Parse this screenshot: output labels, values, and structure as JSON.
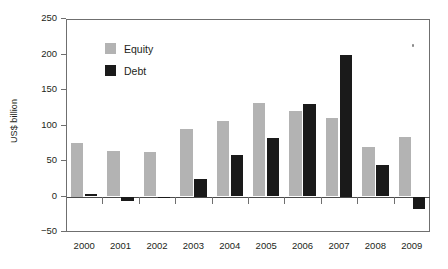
{
  "chart_data": {
    "type": "bar",
    "title": "",
    "xlabel": "",
    "ylabel": "US$ billion",
    "ylim": [
      -50,
      250
    ],
    "yticks": [
      -50,
      0,
      50,
      100,
      150,
      200,
      250
    ],
    "ytick_labels": [
      "−50",
      "0",
      "50",
      "100",
      "150",
      "200",
      "250"
    ],
    "grid": false,
    "legend_position": "upper-left-inside",
    "categories": [
      "2000",
      "2001",
      "2002",
      "2003",
      "2004",
      "2005",
      "2006",
      "2007",
      "2008",
      "2009"
    ],
    "series": [
      {
        "name": "Equity",
        "color": "#b3b3b3",
        "values": [
          75,
          64,
          62,
          95,
          106,
          131,
          120,
          111,
          70,
          84
        ]
      },
      {
        "name": "Debt",
        "color": "#1a1a1a",
        "values": [
          4,
          -6,
          -2,
          25,
          59,
          83,
          130,
          200,
          45,
          -18
        ]
      }
    ]
  },
  "axis": {
    "y_label": "US$ billion"
  },
  "legend": {
    "items": [
      {
        "label": "Equity",
        "swatch": "equity"
      },
      {
        "label": "Debt",
        "swatch": "debt"
      }
    ]
  }
}
